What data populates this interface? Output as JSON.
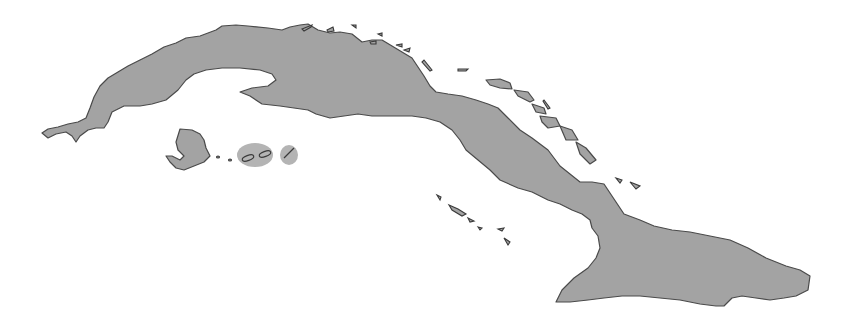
{
  "map": {
    "subject": "Cuba",
    "style": "gray silhouette on white background",
    "colors": {
      "background": "#ffffff",
      "land": "#a3a3a3",
      "coastline": "#4a4a4a",
      "shoal": "#b4b4b4"
    },
    "features": [
      {
        "name": "main-island",
        "label": ""
      },
      {
        "name": "isla-de-la-juventud",
        "label": ""
      },
      {
        "name": "canarreos-cays",
        "label": ""
      },
      {
        "name": "sabana-camaguey-cays",
        "label": ""
      },
      {
        "name": "jardines-de-la-reina-cays",
        "label": ""
      }
    ]
  }
}
